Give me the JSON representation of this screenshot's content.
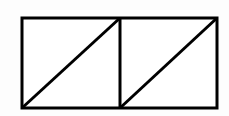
{
  "canvas": {
    "width": 229,
    "height": 116,
    "background_color": "#fdfdfd"
  },
  "figure": {
    "stroke_color": "#000000",
    "fill_color": "#ffffff",
    "stroke_width": 3,
    "outer_rectangle": {
      "name": "outer-rectangle",
      "x": 22,
      "y": 18,
      "width": 195,
      "height": 90
    },
    "divider": {
      "name": "vertical-divider",
      "x1": 120,
      "y1": 18,
      "x2": 120,
      "y2": 108
    },
    "diagonals": [
      {
        "name": "diagonal-left-square",
        "x1": 22,
        "y1": 108,
        "x2": 120,
        "y2": 18
      },
      {
        "name": "diagonal-right-square",
        "x1": 120,
        "y1": 108,
        "x2": 217,
        "y2": 18
      }
    ],
    "squares": [
      {
        "name": "left-square",
        "x": 22,
        "y": 18,
        "width": 98,
        "height": 90
      },
      {
        "name": "right-square",
        "x": 120,
        "y": 18,
        "width": 97,
        "height": 90
      }
    ]
  }
}
